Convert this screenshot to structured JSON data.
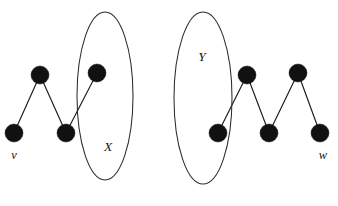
{
  "figure": {
    "type": "graph-diagram",
    "title": "",
    "background_color": "#ffffff",
    "node_color": "#111111",
    "edge_color": "#1a1a1a",
    "ellipse_color": "#2b2b2b",
    "node_radius": 9,
    "nodes": [
      {
        "id": "v",
        "cx": 14,
        "cy": 133,
        "label": "v"
      },
      {
        "id": "n2",
        "cx": 40,
        "cy": 75,
        "label": ""
      },
      {
        "id": "n3",
        "cx": 66,
        "cy": 133,
        "label": ""
      },
      {
        "id": "n4",
        "cx": 97,
        "cy": 73,
        "label": ""
      },
      {
        "id": "n5",
        "cx": 218,
        "cy": 133,
        "label": ""
      },
      {
        "id": "n6",
        "cx": 247,
        "cy": 75,
        "label": ""
      },
      {
        "id": "n7",
        "cx": 269,
        "cy": 133,
        "label": ""
      },
      {
        "id": "n8",
        "cx": 298,
        "cy": 73,
        "label": ""
      },
      {
        "id": "w",
        "cx": 320,
        "cy": 133,
        "label": "w"
      }
    ],
    "edges": [
      {
        "from": "v",
        "to": "n2"
      },
      {
        "from": "n2",
        "to": "n3"
      },
      {
        "from": "n3",
        "to": "n4"
      },
      {
        "from": "n5",
        "to": "n6"
      },
      {
        "from": "n6",
        "to": "n7"
      },
      {
        "from": "n7",
        "to": "n8"
      },
      {
        "from": "n8",
        "to": "w"
      }
    ],
    "ellipses": [
      {
        "id": "X",
        "cx": 105,
        "cy": 96,
        "rx": 28,
        "ry": 84,
        "label": "X",
        "label_x": 108,
        "label_y": 148
      },
      {
        "id": "Y",
        "cx": 203,
        "cy": 98,
        "rx": 29,
        "ry": 86,
        "label": "Y",
        "label_x": 202,
        "label_y": 58
      }
    ],
    "vertex_labels": [
      {
        "id": "v",
        "text": "v",
        "x": 14,
        "y": 156
      },
      {
        "id": "w",
        "text": "w",
        "x": 323,
        "y": 156
      }
    ]
  }
}
